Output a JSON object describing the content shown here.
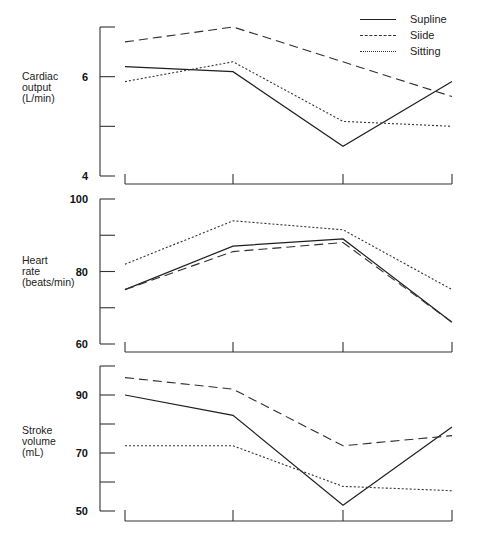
{
  "legend": [
    {
      "name": "Supline",
      "style": "solid"
    },
    {
      "name": "Siide",
      "style": "dashed"
    },
    {
      "name": "Sitting",
      "style": "dotted"
    }
  ],
  "panels": [
    {
      "ylabel": "Cardiac\noutput\n(L/min)",
      "ticks": [
        "6",
        "4"
      ]
    },
    {
      "ylabel": "Heart\nrate\n(beats/min)",
      "ticks": [
        "100",
        "80",
        "60"
      ]
    },
    {
      "ylabel": "Stroke\nvolume\n(mL)",
      "ticks": [
        "90",
        "70",
        "50"
      ]
    }
  ],
  "chart_data": [
    {
      "type": "line",
      "title": "",
      "xlabel": "",
      "ylabel": "Cardiac output (L/min)",
      "x": [
        1,
        2,
        3,
        4
      ],
      "x_tick_labels": [
        "",
        "",
        "",
        ""
      ],
      "ylim": [
        4,
        7
      ],
      "y_tick_labels": [
        "4",
        "6"
      ],
      "minor_ticks": [
        5,
        7
      ],
      "series": [
        {
          "name": "Supline",
          "style": "solid",
          "values": [
            6.2,
            6.1,
            4.6,
            5.9
          ]
        },
        {
          "name": "Siide",
          "style": "dashed",
          "values": [
            6.7,
            7.0,
            6.3,
            5.6
          ]
        },
        {
          "name": "Sitting",
          "style": "dotted",
          "values": [
            5.9,
            6.3,
            5.1,
            5.0
          ]
        }
      ],
      "legend_position": "top-right",
      "grid": false
    },
    {
      "type": "line",
      "title": "",
      "xlabel": "",
      "ylabel": "Heart rate (beats/min)",
      "x": [
        1,
        2,
        3,
        4
      ],
      "x_tick_labels": [
        "",
        "",
        "",
        ""
      ],
      "ylim": [
        60,
        100
      ],
      "y_tick_labels": [
        "60",
        "80",
        "100"
      ],
      "minor_ticks": [
        70,
        90
      ],
      "series": [
        {
          "name": "Supline",
          "style": "solid",
          "values": [
            75,
            87,
            89,
            66
          ]
        },
        {
          "name": "Siide",
          "style": "dashed",
          "values": [
            75,
            85.5,
            88,
            66
          ]
        },
        {
          "name": "Sitting",
          "style": "dotted",
          "values": [
            82,
            94,
            91.5,
            75
          ]
        }
      ],
      "grid": false
    },
    {
      "type": "line",
      "title": "",
      "xlabel": "",
      "ylabel": "Stroke volume (mL)",
      "x": [
        1,
        2,
        3,
        4
      ],
      "x_tick_labels": [
        "",
        "",
        "",
        ""
      ],
      "ylim": [
        50,
        100
      ],
      "y_tick_labels": [
        "50",
        "70",
        "90"
      ],
      "minor_ticks": [
        60,
        80,
        100
      ],
      "series": [
        {
          "name": "Supline",
          "style": "solid",
          "values": [
            90,
            83,
            52,
            79
          ]
        },
        {
          "name": "Siide",
          "style": "dashed",
          "values": [
            96,
            92,
            72.5,
            76
          ]
        },
        {
          "name": "Sitting",
          "style": "dotted",
          "values": [
            72.5,
            72.5,
            58.5,
            57
          ]
        }
      ],
      "grid": false
    }
  ]
}
